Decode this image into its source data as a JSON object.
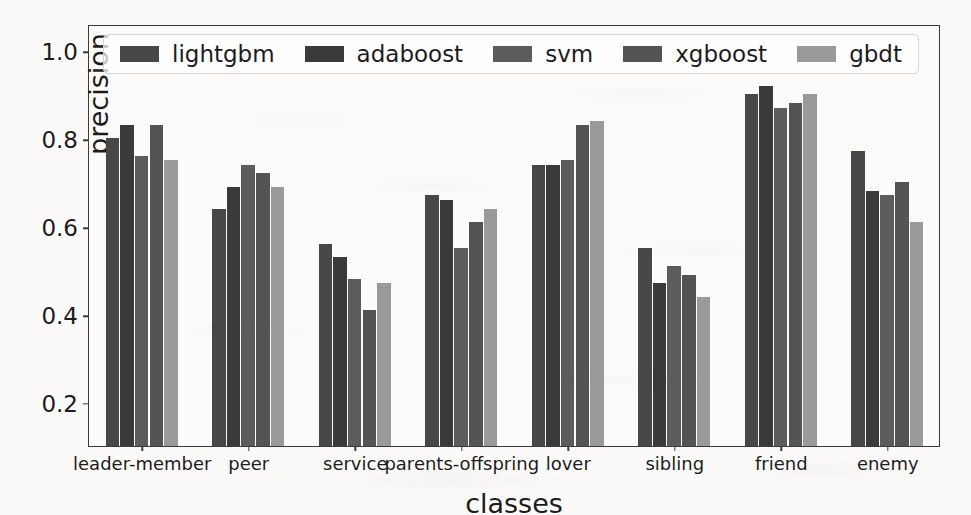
{
  "chart_data": {
    "type": "bar",
    "title": "",
    "xlabel": "classes",
    "ylabel": "precision",
    "ylim": [
      0.1,
      1.06
    ],
    "yticks": [
      "0.2",
      "0.4",
      "0.6",
      "0.8",
      "1.0"
    ],
    "ytick_values": [
      0.2,
      0.4,
      0.6,
      0.8,
      1.0
    ],
    "grid": false,
    "legend_position": "upper-center-inside",
    "categories": [
      "leader-member",
      "peer",
      "service",
      "parents-offspring",
      "lover",
      "sibling",
      "friend",
      "enemy"
    ],
    "series": [
      {
        "name": "lightgbm",
        "color": "#474747",
        "values": [
          0.8,
          0.64,
          0.56,
          0.67,
          0.74,
          0.55,
          0.9,
          0.77
        ]
      },
      {
        "name": "adaboost",
        "color": "#3a3a3a",
        "values": [
          0.83,
          0.69,
          0.53,
          0.66,
          0.74,
          0.47,
          0.92,
          0.68
        ]
      },
      {
        "name": "svm",
        "color": "#5c5c5c",
        "values": [
          0.76,
          0.74,
          0.48,
          0.55,
          0.75,
          0.51,
          0.87,
          0.67
        ]
      },
      {
        "name": "xgboost",
        "color": "#545454",
        "values": [
          0.83,
          0.72,
          0.41,
          0.61,
          0.83,
          0.49,
          0.88,
          0.7
        ]
      },
      {
        "name": "gbdt",
        "color": "#9a9a9a",
        "values": [
          0.75,
          0.69,
          0.47,
          0.64,
          0.84,
          0.44,
          0.9,
          0.61
        ]
      }
    ]
  },
  "legend": {
    "items": [
      {
        "label": "lightgbm",
        "swatch": "legend-swatch-lightgbm"
      },
      {
        "label": "adaboost",
        "swatch": "legend-swatch-adaboost"
      },
      {
        "label": "svm",
        "swatch": "legend-swatch-svm"
      },
      {
        "label": "xgboost",
        "swatch": "legend-swatch-xgboost"
      },
      {
        "label": "gbdt",
        "swatch": "legend-swatch-gbdt"
      }
    ]
  },
  "axes": {
    "y_label": "precision",
    "x_label": "classes"
  }
}
